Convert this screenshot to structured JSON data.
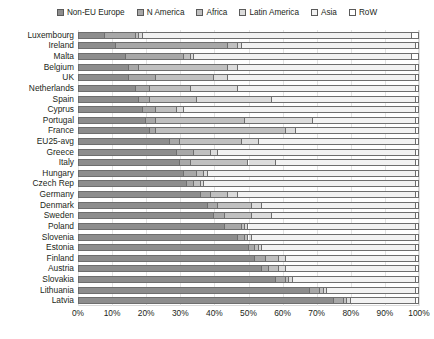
{
  "legend": {
    "items": [
      {
        "label": "Non-EU Europe",
        "color": "#8d8d8d",
        "icon": "legend-swatch-icon"
      },
      {
        "label": "N America",
        "color": "#a8a8a8",
        "icon": "legend-swatch-icon"
      },
      {
        "label": "Africa",
        "color": "#c0c0c0",
        "icon": "legend-swatch-icon"
      },
      {
        "label": "Latin America",
        "color": "#dcdcdc",
        "icon": "legend-swatch-icon"
      },
      {
        "label": "Asia",
        "color": "#f2f2f2",
        "icon": "legend-swatch-icon"
      },
      {
        "label": "RoW",
        "color": "#ffffff",
        "icon": "legend-swatch-icon"
      }
    ]
  },
  "axis": {
    "x_ticks": [
      "0%",
      "10%",
      "20%",
      "30%",
      "40%",
      "50%",
      "60%",
      "70%",
      "80%",
      "90%",
      "100%"
    ],
    "x_min": 0,
    "x_max": 100
  },
  "caption": "",
  "chart_data": {
    "type": "bar",
    "title": "",
    "subtitle": "",
    "xlabel": "",
    "ylabel": "",
    "orientation": "horizontal",
    "stacked": true,
    "normalized_percent": true,
    "xlim": [
      0,
      100
    ],
    "grid": true,
    "legend_position": "top",
    "series_names": [
      "Non-EU Europe",
      "N America",
      "Africa",
      "Latin America",
      "Asia",
      "RoW"
    ],
    "series_colors": [
      "#8d8d8d",
      "#a8a8a8",
      "#c0c0c0",
      "#dcdcdc",
      "#f2f2f2",
      "#ffffff"
    ],
    "categories": [
      "Luxembourg",
      "Ireland",
      "Malta",
      "Belgium",
      "UK",
      "Netherlands",
      "Spain",
      "Cyprus",
      "Portugal",
      "France",
      "EU25-avg",
      "Greece",
      "Italy",
      "Hungary",
      "Czech Rep",
      "Germany",
      "Denmark",
      "Sweden",
      "Poland",
      "Slovenia",
      "Estonia",
      "Finland",
      "Austria",
      "Slovakia",
      "Lithuania",
      "Latvia"
    ],
    "rows": [
      {
        "category": "Luxembourg",
        "values": [
          8,
          9,
          1,
          1,
          79,
          2
        ]
      },
      {
        "category": "Ireland",
        "values": [
          11,
          33,
          3,
          1,
          51,
          1
        ]
      },
      {
        "category": "Malta",
        "values": [
          14,
          17,
          2,
          1,
          64,
          2
        ]
      },
      {
        "category": "Belgium",
        "values": [
          15,
          3,
          26,
          3,
          52,
          1
        ]
      },
      {
        "category": "UK",
        "values": [
          15,
          8,
          17,
          4,
          55,
          1
        ]
      },
      {
        "category": "Netherlands",
        "values": [
          17,
          4,
          12,
          14,
          52,
          1
        ]
      },
      {
        "category": "Spain",
        "values": [
          18,
          3,
          14,
          22,
          42,
          1
        ]
      },
      {
        "category": "Cyprus",
        "values": [
          19,
          4,
          6,
          2,
          68,
          1
        ]
      },
      {
        "category": "Portugal",
        "values": [
          20,
          3,
          26,
          20,
          30,
          1
        ]
      },
      {
        "category": "France",
        "values": [
          21,
          2,
          38,
          3,
          35,
          1
        ]
      },
      {
        "category": "EU25-avg",
        "values": [
          27,
          3,
          18,
          5,
          46,
          1
        ]
      },
      {
        "category": "Greece",
        "values": [
          29,
          5,
          5,
          2,
          58,
          1
        ]
      },
      {
        "category": "Italy",
        "values": [
          30,
          3,
          17,
          8,
          41,
          1
        ]
      },
      {
        "category": "Hungary",
        "values": [
          31,
          4,
          2,
          1,
          61,
          1
        ]
      },
      {
        "category": "Czech Rep",
        "values": [
          32,
          2,
          2,
          1,
          62,
          1
        ]
      },
      {
        "category": "Germany",
        "values": [
          36,
          3,
          5,
          3,
          52,
          1
        ]
      },
      {
        "category": "Denmark",
        "values": [
          38,
          3,
          10,
          3,
          45,
          1
        ]
      },
      {
        "category": "Sweden",
        "values": [
          40,
          3,
          8,
          6,
          42,
          1
        ]
      },
      {
        "category": "Poland",
        "values": [
          43,
          5,
          1,
          1,
          49,
          1
        ]
      },
      {
        "category": "Slovenia",
        "values": [
          47,
          2,
          1,
          1,
          48,
          1
        ]
      },
      {
        "category": "Estonia",
        "values": [
          50,
          2,
          1,
          1,
          45,
          1
        ]
      },
      {
        "category": "Finland",
        "values": [
          52,
          3,
          4,
          2,
          38,
          1
        ]
      },
      {
        "category": "Austria",
        "values": [
          54,
          2,
          3,
          2,
          38,
          1
        ]
      },
      {
        "category": "Slovakia",
        "values": [
          58,
          3,
          1,
          1,
          36,
          1
        ]
      },
      {
        "category": "Lithuania",
        "values": [
          68,
          3,
          1,
          1,
          26,
          1
        ]
      },
      {
        "category": "Latvia",
        "values": [
          75,
          3,
          1,
          1,
          19,
          1
        ]
      }
    ]
  }
}
